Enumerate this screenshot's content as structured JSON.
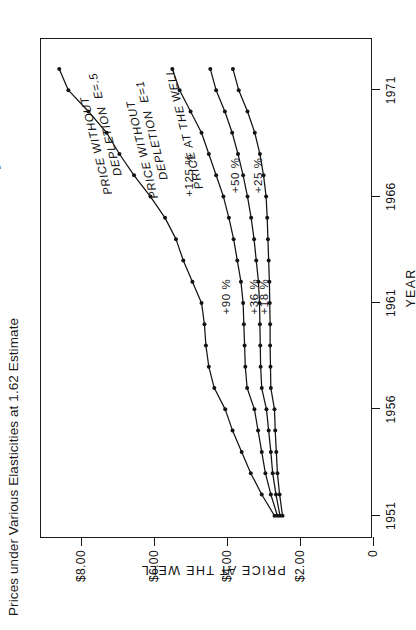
{
  "caption": "Prices under Various Elasticities at 1.62 Estimate",
  "chart_data": {
    "type": "line",
    "title": "Prices under Various Elasticities at 1.62 Estimate",
    "xlabel": "YEAR",
    "ylabel": "PRICE AT THE WELL",
    "xlim": [
      1950,
      1973.5
    ],
    "ylim": [
      0,
      9.1
    ],
    "grid": false,
    "legend_position": "inline-labels",
    "xticks": [
      1951,
      1956,
      1961,
      1966,
      1971
    ],
    "xticklabels": [
      "1951",
      "1956",
      "1961",
      "1966",
      "1971"
    ],
    "yticks": [
      0,
      2,
      4,
      6,
      8
    ],
    "yticklabels": [
      "0",
      "$2.00",
      "$4.00",
      "$6.00",
      "$8.00"
    ],
    "series": [
      {
        "name": "PRICE WITHOUT\nDEPLETION  E=.2",
        "label_line1": "PRICE WITHOUT",
        "label_line2": "DEPLETION  E=.2",
        "annotation": "+125 %",
        "annotation2": "+90 %",
        "x": [
          1951,
          1952,
          1953,
          1954,
          1955,
          1956,
          1957,
          1958,
          1959,
          1960,
          1961,
          1962,
          1963,
          1964,
          1965,
          1966,
          1967,
          1968,
          1969,
          1970,
          1971,
          1972
        ],
        "y": [
          2.7,
          3.05,
          3.35,
          3.6,
          3.85,
          4.05,
          4.35,
          4.5,
          4.58,
          4.62,
          4.7,
          4.95,
          5.2,
          5.4,
          5.7,
          6.1,
          6.55,
          6.95,
          7.3,
          7.8,
          8.35,
          8.6
        ]
      },
      {
        "name": "PRICE WITHOUT\nDEPLETION  E=.5",
        "label_line1": "PRICE WITHOUT",
        "label_line2": "DEPLETION  E=.5",
        "annotation": "+50 %",
        "annotation2": "+36 %",
        "x": [
          1951,
          1952,
          1953,
          1954,
          1955,
          1956,
          1957,
          1958,
          1959,
          1960,
          1961,
          1962,
          1963,
          1964,
          1965,
          1966,
          1967,
          1968,
          1969,
          1970,
          1971,
          1972
        ],
        "y": [
          2.62,
          2.8,
          2.95,
          3.05,
          3.15,
          3.25,
          3.45,
          3.5,
          3.52,
          3.54,
          3.56,
          3.62,
          3.72,
          3.82,
          3.95,
          4.1,
          4.3,
          4.5,
          4.7,
          5.0,
          5.3,
          5.5
        ]
      },
      {
        "name": "PRICE WITHOUT\nDEPLETION  E=1",
        "label_line1": "PRICE WITHOUT",
        "label_line2": "DEPLETION  E=1",
        "annotation": "+25 %",
        "annotation2": "+18 %",
        "x": [
          1951,
          1952,
          1953,
          1954,
          1955,
          1956,
          1957,
          1958,
          1959,
          1960,
          1961,
          1962,
          1963,
          1964,
          1965,
          1966,
          1967,
          1968,
          1969,
          1970,
          1971,
          1972
        ],
        "y": [
          2.55,
          2.66,
          2.75,
          2.8,
          2.86,
          2.92,
          3.05,
          3.08,
          3.09,
          3.1,
          3.11,
          3.14,
          3.2,
          3.26,
          3.34,
          3.44,
          3.56,
          3.7,
          3.86,
          4.06,
          4.3,
          4.46
        ]
      },
      {
        "name": "PRICE AT THE WELL",
        "label_line1": "PRICE AT THE WELL",
        "label_line2": "",
        "annotation": "",
        "annotation2": "",
        "x": [
          1951,
          1952,
          1953,
          1954,
          1955,
          1956,
          1957,
          1958,
          1959,
          1960,
          1961,
          1962,
          1963,
          1964,
          1965,
          1966,
          1967,
          1968,
          1969,
          1970,
          1971,
          1972
        ],
        "y": [
          2.48,
          2.56,
          2.62,
          2.65,
          2.68,
          2.7,
          2.8,
          2.81,
          2.82,
          2.82,
          2.83,
          2.84,
          2.86,
          2.88,
          2.9,
          2.93,
          3.0,
          3.1,
          3.24,
          3.44,
          3.68,
          3.84
        ]
      }
    ],
    "annotations": [
      "+125 %",
      "+90 %",
      "+50 %",
      "+36 %",
      "+25 %",
      "+18 %"
    ]
  }
}
